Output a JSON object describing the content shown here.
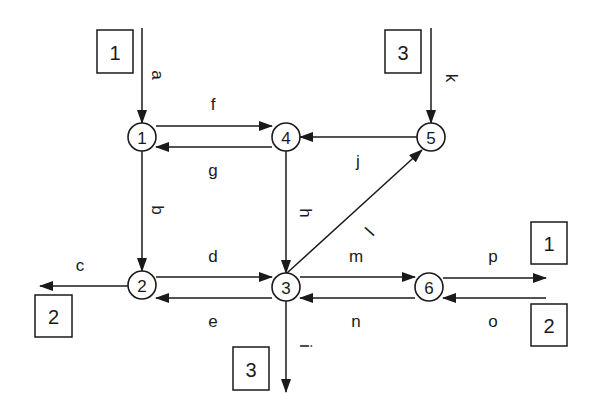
{
  "diagram": {
    "title": "",
    "colors": {
      "ink": "#1a1a1a",
      "background": "#ffffff"
    },
    "nodes": [
      {
        "id": "1",
        "label": "1",
        "x": 142,
        "y": 137
      },
      {
        "id": "2",
        "label": "2",
        "x": 142,
        "y": 285
      },
      {
        "id": "3",
        "label": "3",
        "x": 286,
        "y": 287
      },
      {
        "id": "4",
        "label": "4",
        "x": 286,
        "y": 137
      },
      {
        "id": "5",
        "label": "5",
        "x": 431,
        "y": 137
      },
      {
        "id": "6",
        "label": "6",
        "x": 429,
        "y": 287
      }
    ],
    "boxes": [
      {
        "id": "source-1",
        "label": "1",
        "x": 97,
        "y": 30,
        "w": 36,
        "h": 43
      },
      {
        "id": "source-3",
        "label": "3",
        "x": 385,
        "y": 30,
        "w": 36,
        "h": 43
      },
      {
        "id": "sink-2-left",
        "label": "2",
        "x": 35,
        "y": 295,
        "w": 37,
        "h": 42
      },
      {
        "id": "sink-3-bottom",
        "label": "3",
        "x": 233,
        "y": 347,
        "w": 36,
        "h": 43
      },
      {
        "id": "sink-1-right",
        "label": "1",
        "x": 531,
        "y": 222,
        "w": 36,
        "h": 42
      },
      {
        "id": "source-2-right",
        "label": "2",
        "x": 531,
        "y": 304,
        "w": 36,
        "h": 42
      }
    ],
    "edges": [
      {
        "id": "a",
        "label": "a",
        "from": "box 1 (in)",
        "to": "1",
        "x1": 142,
        "y1": 28,
        "x2": 142,
        "y2": 123,
        "lx": 157,
        "ly": 75,
        "rotate": 90
      },
      {
        "id": "b",
        "label": "b",
        "from": "1",
        "to": "2",
        "x1": 142,
        "y1": 151,
        "x2": 142,
        "y2": 271,
        "lx": 157,
        "ly": 210,
        "rotate": 90
      },
      {
        "id": "c",
        "label": "c",
        "from": "2",
        "to": "box 2 (out)",
        "x1": 128,
        "y1": 286,
        "x2": 40,
        "y2": 286,
        "lx": 80,
        "ly": 265,
        "rotate": 0
      },
      {
        "id": "d",
        "label": "d",
        "from": "2",
        "to": "3",
        "x1": 156,
        "y1": 277,
        "x2": 272,
        "y2": 277,
        "lx": 213,
        "ly": 256,
        "rotate": 0
      },
      {
        "id": "e",
        "label": "e",
        "from": "3",
        "to": "2",
        "x1": 272,
        "y1": 298,
        "x2": 156,
        "y2": 298,
        "lx": 213,
        "ly": 321,
        "rotate": 0
      },
      {
        "id": "f",
        "label": "f",
        "from": "1",
        "to": "4",
        "x1": 156,
        "y1": 126,
        "x2": 272,
        "y2": 126,
        "lx": 213,
        "ly": 104,
        "rotate": 0
      },
      {
        "id": "g",
        "label": "g",
        "from": "4",
        "to": "1",
        "x1": 272,
        "y1": 147,
        "x2": 156,
        "y2": 147,
        "lx": 213,
        "ly": 170,
        "rotate": 0
      },
      {
        "id": "h",
        "label": "h",
        "from": "4",
        "to": "3",
        "x1": 286,
        "y1": 151,
        "x2": 286,
        "y2": 273,
        "lx": 305,
        "ly": 213,
        "rotate": 90
      },
      {
        "id": "i",
        "label": "i",
        "from": "3",
        "to": "box 3 (out)",
        "x1": 286,
        "y1": 301,
        "x2": 286,
        "y2": 392,
        "lx": 305,
        "ly": 346,
        "rotate": 90
      },
      {
        "id": "j",
        "label": "j",
        "from": "5",
        "to": "4",
        "x1": 417,
        "y1": 137,
        "x2": 300,
        "y2": 137,
        "lx": 358,
        "ly": 161,
        "rotate": 0
      },
      {
        "id": "k",
        "label": "k",
        "from": "box 3 (in)",
        "to": "5",
        "x1": 431,
        "y1": 28,
        "x2": 431,
        "y2": 123,
        "lx": 451,
        "ly": 78,
        "rotate": 90
      },
      {
        "id": "l",
        "label": "l",
        "from": "3",
        "to": "5",
        "x1": 287,
        "y1": 273,
        "x2": 422,
        "y2": 150,
        "lx": 370,
        "ly": 232,
        "rotate": -48
      },
      {
        "id": "m",
        "label": "m",
        "from": "3",
        "to": "6",
        "x1": 300,
        "y1": 277,
        "x2": 415,
        "y2": 277,
        "lx": 356,
        "ly": 256,
        "rotate": 0
      },
      {
        "id": "n",
        "label": "n",
        "from": "6",
        "to": "3",
        "x1": 415,
        "y1": 298,
        "x2": 300,
        "y2": 298,
        "lx": 356,
        "ly": 321,
        "rotate": 0
      },
      {
        "id": "o",
        "label": "o",
        "from": "box 2 (in)",
        "to": "6",
        "x1": 546,
        "y1": 298,
        "x2": 443,
        "y2": 298,
        "lx": 493,
        "ly": 321,
        "rotate": 0
      },
      {
        "id": "p",
        "label": "p",
        "from": "6",
        "to": "box 1 (out)",
        "x1": 443,
        "y1": 278,
        "x2": 546,
        "y2": 278,
        "lx": 493,
        "ly": 256,
        "rotate": 0
      }
    ]
  }
}
